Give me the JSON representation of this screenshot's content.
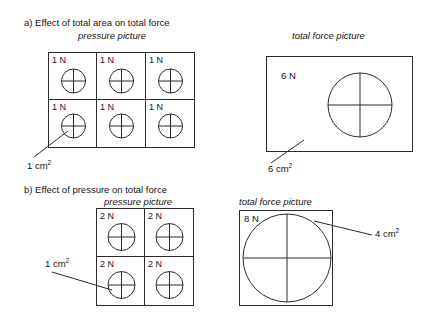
{
  "figure": {
    "title_hidden": "",
    "parts": [
      {
        "id": "a",
        "heading": "a) Effect of total area on total force",
        "left_caption": "pressure picture",
        "right_caption": "total force picture",
        "grid": {
          "columns": 3,
          "rows": 2,
          "cell_labels": [
            "1 N",
            "1 N",
            "1 N",
            "1 N",
            "1 N",
            "1 N"
          ]
        },
        "grid_area_label": "1 cm",
        "grid_area_exponent": "2",
        "total": {
          "force_label": "6 N",
          "area_label": "6 cm",
          "area_exponent": "2",
          "shape": "rectangle"
        }
      },
      {
        "id": "b",
        "heading": "b) Effect of pressure on total force",
        "left_caption": "pressure picture",
        "right_caption": "total force picture",
        "grid": {
          "columns": 2,
          "rows": 2,
          "cell_labels": [
            "2 N",
            "2 N",
            "2 N",
            "2 N"
          ]
        },
        "grid_area_label": "1 cm",
        "grid_area_exponent": "2",
        "total": {
          "force_label": "8 N",
          "area_label": "4 cm",
          "area_exponent": "2",
          "shape": "square"
        }
      }
    ],
    "colors": {
      "stroke": "#2b2b2b",
      "text": "#141414",
      "background": "#ffffff"
    }
  }
}
